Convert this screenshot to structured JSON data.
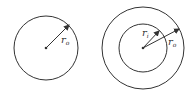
{
  "diagram": {
    "left": {
      "label_main": "r",
      "label_sub": "o"
    },
    "right": {
      "inner_label_main": "r",
      "inner_label_sub": "i",
      "outer_label_main": "r",
      "outer_label_sub": "o"
    },
    "stroke_color": "#333333"
  }
}
